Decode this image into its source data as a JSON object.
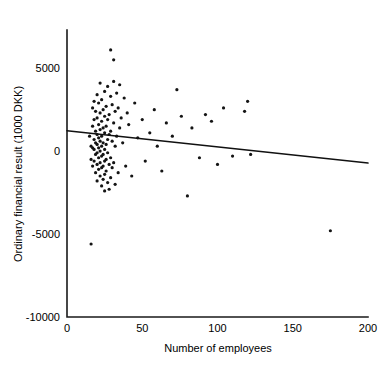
{
  "chart_data": {
    "type": "scatter",
    "title": "",
    "xlabel": "Number of employees",
    "ylabel": "Ordinary financial result (1000 DKK)",
    "xlim": [
      0,
      200
    ],
    "ylim": [
      -10000,
      7300
    ],
    "xticks": [
      0,
      50,
      100,
      150,
      200
    ],
    "xtick_labels": [
      "0",
      "50",
      "100",
      "150",
      "200"
    ],
    "yticks": [
      5000,
      0,
      -5000,
      -10000
    ],
    "ytick_labels": [
      "5000",
      "0",
      "-5000",
      "-10000"
    ],
    "grid": false,
    "legend": false,
    "marker_color": "#141414",
    "line_color": "#111111",
    "axis_color": "#1a1a1a",
    "series": [
      {
        "name": "Firms",
        "type": "scatter",
        "points": [
          [
            16,
            -5600
          ],
          [
            15,
            900
          ],
          [
            16,
            300
          ],
          [
            16,
            -500
          ],
          [
            17,
            1500
          ],
          [
            17,
            2600
          ],
          [
            17,
            200
          ],
          [
            17,
            -900
          ],
          [
            18,
            3000
          ],
          [
            18,
            1900
          ],
          [
            18,
            700
          ],
          [
            18,
            100
          ],
          [
            18,
            -600
          ],
          [
            19,
            2400
          ],
          [
            19,
            1200
          ],
          [
            19,
            500
          ],
          [
            19,
            -200
          ],
          [
            19,
            -1300
          ],
          [
            20,
            3400
          ],
          [
            20,
            2000
          ],
          [
            20,
            1000
          ],
          [
            20,
            400
          ],
          [
            20,
            -100
          ],
          [
            20,
            -800
          ],
          [
            20,
            -1800
          ],
          [
            21,
            2900
          ],
          [
            21,
            1600
          ],
          [
            21,
            800
          ],
          [
            21,
            200
          ],
          [
            21,
            -400
          ],
          [
            21,
            -1100
          ],
          [
            22,
            4100
          ],
          [
            22,
            2300
          ],
          [
            22,
            1300
          ],
          [
            22,
            600
          ],
          [
            22,
            0
          ],
          [
            22,
            -700
          ],
          [
            22,
            -1500
          ],
          [
            23,
            3100
          ],
          [
            23,
            1800
          ],
          [
            23,
            900
          ],
          [
            23,
            300
          ],
          [
            23,
            -300
          ],
          [
            23,
            -1000
          ],
          [
            23,
            -2100
          ],
          [
            24,
            2500
          ],
          [
            24,
            1400
          ],
          [
            24,
            500
          ],
          [
            24,
            -200
          ],
          [
            24,
            -900
          ],
          [
            24,
            -1700
          ],
          [
            25,
            3600
          ],
          [
            25,
            2100
          ],
          [
            25,
            1100
          ],
          [
            25,
            100
          ],
          [
            25,
            -600
          ],
          [
            25,
            -1400
          ],
          [
            25,
            -2400
          ],
          [
            26,
            2700
          ],
          [
            26,
            1500
          ],
          [
            26,
            400
          ],
          [
            26,
            -500
          ],
          [
            26,
            -1200
          ],
          [
            27,
            3900
          ],
          [
            27,
            1900
          ],
          [
            27,
            700
          ],
          [
            27,
            -100
          ],
          [
            27,
            -1900
          ],
          [
            28,
            2200
          ],
          [
            28,
            1000
          ],
          [
            28,
            -800
          ],
          [
            28,
            -2300
          ],
          [
            29,
            6100
          ],
          [
            29,
            3300
          ],
          [
            29,
            1200
          ],
          [
            29,
            -400
          ],
          [
            29,
            -1600
          ],
          [
            30,
            2800
          ],
          [
            30,
            600
          ],
          [
            30,
            -1000
          ],
          [
            31,
            5500
          ],
          [
            31,
            4200
          ],
          [
            31,
            1700
          ],
          [
            31,
            -700
          ],
          [
            32,
            2400
          ],
          [
            32,
            300
          ],
          [
            32,
            -2000
          ],
          [
            33,
            3500
          ],
          [
            33,
            900
          ],
          [
            34,
            2600
          ],
          [
            34,
            -1300
          ],
          [
            35,
            4000
          ],
          [
            35,
            1400
          ],
          [
            36,
            2000
          ],
          [
            37,
            500
          ],
          [
            38,
            3200
          ],
          [
            39,
            -900
          ],
          [
            40,
            2300
          ],
          [
            41,
            1600
          ],
          [
            43,
            -1500
          ],
          [
            45,
            2900
          ],
          [
            47,
            800
          ],
          [
            50,
            1900
          ],
          [
            52,
            -600
          ],
          [
            55,
            1100
          ],
          [
            58,
            2500
          ],
          [
            60,
            300
          ],
          [
            63,
            -1200
          ],
          [
            66,
            1700
          ],
          [
            70,
            900
          ],
          [
            73,
            3700
          ],
          [
            76,
            2100
          ],
          [
            80,
            -2700
          ],
          [
            83,
            1400
          ],
          [
            88,
            -400
          ],
          [
            92,
            2200
          ],
          [
            96,
            1800
          ],
          [
            100,
            -800
          ],
          [
            104,
            2600
          ],
          [
            110,
            -300
          ],
          [
            118,
            2400
          ],
          [
            120,
            3000
          ],
          [
            122,
            -200
          ],
          [
            175,
            -4800
          ]
        ]
      },
      {
        "name": "Linear fit",
        "type": "line",
        "points": [
          [
            0,
            1230
          ],
          [
            200,
            -720
          ]
        ]
      }
    ]
  }
}
